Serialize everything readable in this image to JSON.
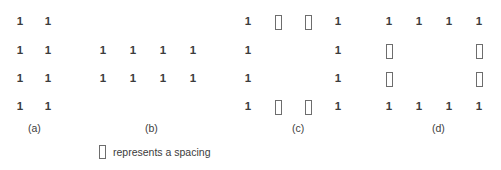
{
  "figure": {
    "spacing_symbol": "spacing-box",
    "legend": {
      "symbol": "spacing-box",
      "text": "represents a spacing"
    },
    "groups": [
      {
        "id": "a",
        "label": "(a)",
        "label_x": 28,
        "origin_x": 12,
        "col_step": 28,
        "cols": 2,
        "rows": 4,
        "cells": [
          [
            "1",
            "1"
          ],
          [
            "1",
            "1"
          ],
          [
            "1",
            "1"
          ],
          [
            "1",
            "1"
          ]
        ]
      },
      {
        "id": "b",
        "label": "(b)",
        "label_x": 145,
        "origin_x": 95,
        "col_step": 30,
        "cols": 4,
        "rows": 4,
        "cells": [
          [
            "",
            "",
            "",
            ""
          ],
          [
            "1",
            "1",
            "1",
            "1"
          ],
          [
            "1",
            "1",
            "1",
            "1"
          ],
          [
            "",
            "",
            "",
            ""
          ]
        ]
      },
      {
        "id": "c",
        "label": "(c)",
        "label_x": 292,
        "origin_x": 240,
        "col_step": 30,
        "cols": 4,
        "rows": 4,
        "cells": [
          [
            "1",
            "spacing-box",
            "spacing-box",
            "1"
          ],
          [
            "1",
            "",
            "",
            "1"
          ],
          [
            "1",
            "",
            "",
            "1"
          ],
          [
            "1",
            "spacing-box",
            "spacing-box",
            "1"
          ]
        ]
      },
      {
        "id": "d",
        "label": "(d)",
        "label_x": 432,
        "origin_x": 381,
        "col_step": 30,
        "cols": 4,
        "rows": 4,
        "cells": [
          [
            "1",
            "1",
            "1",
            "1"
          ],
          [
            "spacing-box",
            "",
            "",
            "spacing-box"
          ],
          [
            "spacing-box",
            "",
            "",
            "spacing-box"
          ],
          [
            "1",
            "1",
            "1",
            "1"
          ]
        ]
      }
    ],
    "row_y": [
      13,
      42,
      70,
      98
    ],
    "label_y": 122
  }
}
